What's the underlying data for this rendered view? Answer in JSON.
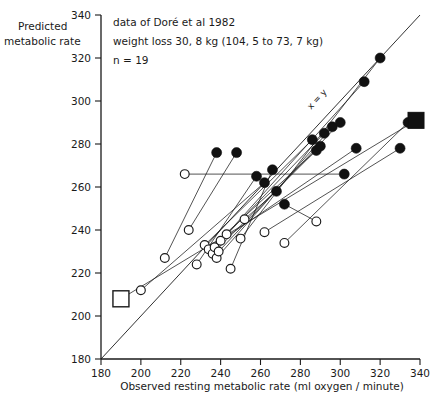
{
  "chart_data": {
    "type": "scatter",
    "title": "",
    "xlabel": "Observed resting metabolic rate  (ml oxygen / minute)",
    "ylabel_line1": "Predicted",
    "ylabel_line2": "metabolic rate",
    "xlim": [
      180,
      340
    ],
    "ylim": [
      180,
      340
    ],
    "xticks": [
      180,
      200,
      220,
      240,
      260,
      280,
      300,
      320,
      340
    ],
    "yticks": [
      180,
      200,
      220,
      240,
      260,
      280,
      300,
      320,
      340
    ],
    "grid": false,
    "legend": "none",
    "annotations": [
      "data of Doré et al 1982",
      "weight loss 30, 8 kg (104, 5 to 73, 7 kg)",
      "n = 19"
    ],
    "reference_line": {
      "label": "x = y",
      "slope": 1,
      "intercept": 0
    },
    "series": [
      {
        "name": "obese before weight loss",
        "marker": "open-circle",
        "points": [
          [
            212,
            227
          ],
          [
            222,
            266
          ],
          [
            224,
            240
          ],
          [
            228,
            224
          ],
          [
            232,
            233
          ],
          [
            234,
            231
          ],
          [
            236,
            229
          ],
          [
            237,
            232
          ],
          [
            238,
            227
          ],
          [
            239,
            230
          ],
          [
            240,
            235
          ],
          [
            243,
            238
          ],
          [
            245,
            222
          ],
          [
            250,
            236
          ],
          [
            252,
            245
          ],
          [
            262,
            239
          ],
          [
            272,
            234
          ],
          [
            288,
            244
          ],
          [
            200,
            212
          ]
        ]
      },
      {
        "name": "after weight loss",
        "marker": "filled-circle",
        "points": [
          [
            238,
            276
          ],
          [
            248,
            276
          ],
          [
            258,
            265
          ],
          [
            262,
            262
          ],
          [
            266,
            268
          ],
          [
            268,
            258
          ],
          [
            272,
            252
          ],
          [
            286,
            282
          ],
          [
            288,
            277
          ],
          [
            290,
            279
          ],
          [
            292,
            285
          ],
          [
            296,
            288
          ],
          [
            300,
            290
          ],
          [
            302,
            266
          ],
          [
            308,
            278
          ],
          [
            312,
            309
          ],
          [
            320,
            320
          ],
          [
            330,
            278
          ],
          [
            334,
            290
          ]
        ]
      },
      {
        "name": "group mean before",
        "marker": "open-square",
        "points": [
          [
            190,
            208
          ]
        ]
      },
      {
        "name": "group mean after",
        "marker": "filled-square",
        "points": [
          [
            338,
            291
          ]
        ]
      }
    ],
    "connections": [
      [
        [
          212,
          227
        ],
        [
          238,
          276
        ]
      ],
      [
        [
          222,
          266
        ],
        [
          302,
          266
        ]
      ],
      [
        [
          224,
          240
        ],
        [
          248,
          276
        ]
      ],
      [
        [
          228,
          224
        ],
        [
          258,
          265
        ]
      ],
      [
        [
          232,
          233
        ],
        [
          286,
          282
        ]
      ],
      [
        [
          234,
          231
        ],
        [
          288,
          277
        ]
      ],
      [
        [
          236,
          229
        ],
        [
          290,
          279
        ]
      ],
      [
        [
          237,
          232
        ],
        [
          292,
          285
        ]
      ],
      [
        [
          238,
          227
        ],
        [
          296,
          288
        ]
      ],
      [
        [
          239,
          230
        ],
        [
          300,
          290
        ]
      ],
      [
        [
          240,
          235
        ],
        [
          308,
          278
        ]
      ],
      [
        [
          243,
          238
        ],
        [
          312,
          309
        ]
      ],
      [
        [
          245,
          222
        ],
        [
          266,
          268
        ]
      ],
      [
        [
          250,
          236
        ],
        [
          320,
          320
        ]
      ],
      [
        [
          252,
          245
        ],
        [
          268,
          258
        ]
      ],
      [
        [
          262,
          239
        ],
        [
          330,
          278
        ]
      ],
      [
        [
          272,
          234
        ],
        [
          334,
          290
        ]
      ],
      [
        [
          288,
          244
        ],
        [
          272,
          252
        ]
      ],
      [
        [
          200,
          212
        ],
        [
          262,
          262
        ]
      ],
      [
        [
          190,
          208
        ],
        [
          338,
          291
        ]
      ]
    ]
  }
}
